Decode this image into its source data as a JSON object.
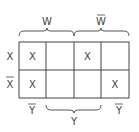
{
  "diagram": {
    "type": "karnaugh-map",
    "top_labels": [
      {
        "text": "W",
        "overbar": false
      },
      {
        "text": "W",
        "overbar": true
      }
    ],
    "row_labels": [
      {
        "text": "X",
        "overbar": false
      },
      {
        "text": "X",
        "overbar": true
      }
    ],
    "bottom_labels": [
      {
        "text": "Y",
        "overbar": true
      },
      {
        "text": "Y",
        "overbar": false
      },
      {
        "text": "Y",
        "overbar": true
      }
    ],
    "cells": [
      [
        "X",
        "",
        "X",
        ""
      ],
      [
        "X",
        "",
        "",
        "X"
      ]
    ]
  }
}
